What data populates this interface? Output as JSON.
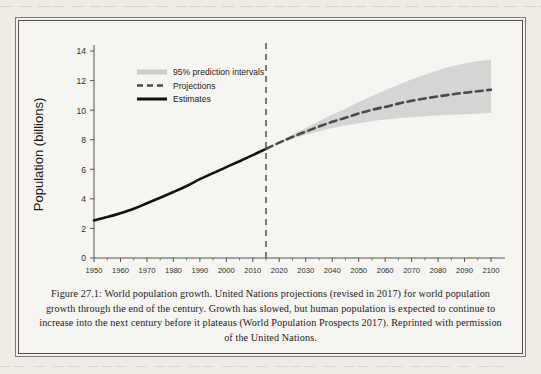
{
  "page": {
    "bleed_top_text": "— —  ——  — ——  —— —  ———  — ——  ——  — ———  ——  — ——  ——— —  ——",
    "bleed_bottom_text": "——  — ——  ———  — ——  ——  —— —  ———  — ——  ——  ——— —  ——"
  },
  "caption": {
    "text": "Figure 27.1: World population growth. United Nations projections (revised in 2017) for world population growth through the end of the century. Growth has slowed, but human population is expected to continue to increase into the next century before it plateaus (World Population Prospects 2017). Reprinted with permission of the United Nations."
  },
  "colors": {
    "estimates_line": "#111111",
    "projection_line": "#4a4a4a",
    "interval_band": "#cfcfcf",
    "divider_line": "#5a5a5a",
    "axis": "#555555",
    "tick_text": "#2b2b2b",
    "paper": "#f7f5f1"
  },
  "chart_data": {
    "type": "line",
    "title": "",
    "xlabel": "",
    "ylabel": "Population (billions)",
    "xlim": [
      1950,
      2100
    ],
    "ylim": [
      0,
      14
    ],
    "grid": false,
    "legend_position": "top-left",
    "xticks": [
      1950,
      1960,
      1970,
      1980,
      1990,
      2000,
      2010,
      2020,
      2030,
      2040,
      2050,
      2060,
      2070,
      2080,
      2090,
      2100
    ],
    "yticks": [
      0,
      2,
      4,
      6,
      8,
      10,
      12,
      14
    ],
    "divider_year": 2015,
    "legend": [
      {
        "label": "95% prediction intervals",
        "style": "band"
      },
      {
        "label": "Projections",
        "style": "dashed"
      },
      {
        "label": "Estimates",
        "style": "solid"
      }
    ],
    "series": [
      {
        "name": "Estimates",
        "style": "solid",
        "x": [
          1950,
          1955,
          1960,
          1965,
          1970,
          1975,
          1980,
          1985,
          1990,
          1995,
          2000,
          2005,
          2010,
          2015
        ],
        "values": [
          2.54,
          2.77,
          3.03,
          3.33,
          3.7,
          4.07,
          4.46,
          4.87,
          5.33,
          5.74,
          6.15,
          6.54,
          6.96,
          7.38
        ]
      },
      {
        "name": "Projections",
        "style": "dashed",
        "x": [
          2015,
          2020,
          2025,
          2030,
          2035,
          2040,
          2045,
          2050,
          2055,
          2060,
          2065,
          2070,
          2075,
          2080,
          2085,
          2090,
          2095,
          2100
        ],
        "values": [
          7.38,
          7.8,
          8.19,
          8.55,
          8.89,
          9.21,
          9.48,
          9.77,
          10.02,
          10.22,
          10.44,
          10.63,
          10.79,
          10.93,
          11.06,
          11.18,
          11.28,
          11.38
        ]
      }
    ],
    "interval_band": {
      "name": "95% prediction intervals",
      "x": [
        2015,
        2020,
        2025,
        2030,
        2035,
        2040,
        2045,
        2050,
        2055,
        2060,
        2065,
        2070,
        2075,
        2080,
        2085,
        2090,
        2095,
        2100
      ],
      "upper": [
        7.38,
        7.86,
        8.33,
        8.79,
        9.25,
        9.7,
        10.1,
        10.55,
        10.95,
        11.35,
        11.72,
        12.08,
        12.4,
        12.7,
        12.95,
        13.15,
        13.3,
        13.4
      ],
      "lower": [
        7.38,
        7.74,
        8.06,
        8.33,
        8.58,
        8.79,
        8.96,
        9.12,
        9.25,
        9.36,
        9.45,
        9.52,
        9.58,
        9.63,
        9.68,
        9.72,
        9.76,
        9.8
      ]
    }
  }
}
